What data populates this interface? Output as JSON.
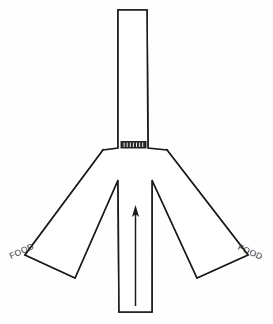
{
  "figure": {
    "kind": "y-maze-apparatus-diagram",
    "background_color": "#fefefe",
    "line_color": "#1a1a1a",
    "fill_color": "#ffffff",
    "width": 273,
    "height": 324
  },
  "labels": {
    "food_left": "FOOD",
    "food_right": "FOOD"
  },
  "arms": {
    "start_arm": {
      "name": "start-arm",
      "orientation": "vertical",
      "label": ""
    },
    "goal_arm_left": {
      "name": "goal-arm-left",
      "orientation": "diagonal-down-left",
      "label": "FOOD"
    },
    "goal_arm_right": {
      "name": "goal-arm-right",
      "orientation": "diagonal-down-right",
      "label": "FOOD"
    },
    "top_arm": {
      "name": "top-arm",
      "orientation": "vertical-up",
      "label": ""
    }
  },
  "gate": {
    "name": "hatched-gate",
    "description": "hatched barrier block",
    "hatch_count": 7,
    "color": "#2b2b2b"
  },
  "arrow": {
    "name": "direction-arrow",
    "direction": "up",
    "color": "#1a1a1a"
  },
  "geometry": {
    "stem_left_x": 118,
    "stem_right_x": 150,
    "stem_top_y": 10,
    "stem_bottom_y": 312,
    "gate_top_y": 142,
    "gate_bottom_y": 148,
    "junction_y": 150,
    "notch_y": 180,
    "left_outer_corner_x": 103,
    "right_outer_corner_x": 167,
    "arrow_tail_y": 305,
    "arrow_tip_y": 206
  }
}
